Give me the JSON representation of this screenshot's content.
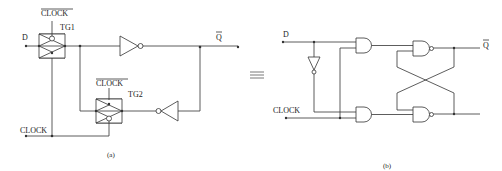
{
  "diagram": {
    "type": "circuit-schematic",
    "equivalence_symbol": "≡",
    "panel_a": {
      "caption": "(a)",
      "inputs": {
        "data": "D",
        "clock": "CLOCK"
      },
      "output": "Q̄",
      "output_label": "Q",
      "gates": [
        {
          "id": "TG1",
          "label": "TG1",
          "type": "transmission-gate",
          "control_label": "CLOCK",
          "control_overbar": true
        },
        {
          "id": "TG2",
          "label": "TG2",
          "type": "transmission-gate",
          "control_label": "CLOCK",
          "control_overbar": true
        },
        {
          "id": "INV1",
          "type": "inverter",
          "direction": "right"
        },
        {
          "id": "INV2",
          "type": "inverter",
          "direction": "left"
        }
      ]
    },
    "panel_b": {
      "caption": "(b)",
      "inputs": {
        "data": "D",
        "clock": "CLOCK"
      },
      "output": "Q̄",
      "output_label": "Q",
      "gates": [
        {
          "id": "INV",
          "type": "inverter",
          "direction": "down"
        },
        {
          "id": "AND1",
          "type": "and"
        },
        {
          "id": "AND2",
          "type": "and"
        },
        {
          "id": "NAND1",
          "type": "nand"
        },
        {
          "id": "NAND2",
          "type": "nand"
        }
      ]
    }
  }
}
